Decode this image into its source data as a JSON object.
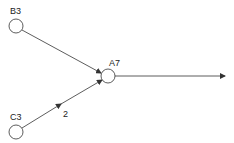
{
  "diagram": {
    "type": "directed-graph",
    "nodes": [
      {
        "id": "B3",
        "label": "B3"
      },
      {
        "id": "C3",
        "label": "C3"
      },
      {
        "id": "A7",
        "label": "A7"
      }
    ],
    "edges": [
      {
        "from": "B3",
        "to": "A7",
        "label": ""
      },
      {
        "from": "C3",
        "to": "A7",
        "label": "2"
      },
      {
        "from": "A7",
        "to": "output",
        "label": ""
      }
    ],
    "colors": {
      "stroke": "#333333",
      "text": "#222222",
      "background": "#ffffff"
    }
  }
}
